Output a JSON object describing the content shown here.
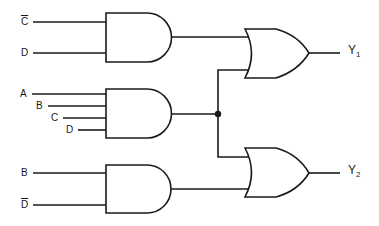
{
  "diagram": {
    "type": "logic-circuit",
    "gates": [
      {
        "id": "and1",
        "type": "AND",
        "inputs": [
          "C̄",
          "D"
        ]
      },
      {
        "id": "and2",
        "type": "AND",
        "inputs": [
          "A",
          "B",
          "C",
          "D"
        ]
      },
      {
        "id": "and3",
        "type": "AND",
        "inputs": [
          "B",
          "D̄"
        ]
      },
      {
        "id": "or1",
        "type": "OR",
        "inputs": [
          "and1",
          "and2"
        ],
        "output": "Y1"
      },
      {
        "id": "or2",
        "type": "OR",
        "inputs": [
          "and2",
          "and3"
        ],
        "output": "Y2"
      }
    ],
    "labels": {
      "g1_in1": "C",
      "g1_in2": "D",
      "g2_in1": "A",
      "g2_in2": "B",
      "g2_in3": "C",
      "g2_in4": "D",
      "g3_in1": "B",
      "g3_in2": "D",
      "y1_main": "Y",
      "y1_sub": "1",
      "y2_main": "Y",
      "y2_sub": "2"
    },
    "colors": {
      "line": "#1a1a1a",
      "background": "#ffffff"
    }
  }
}
